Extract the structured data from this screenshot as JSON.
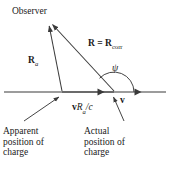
{
  "figure": {
    "background_color": "#ffffff",
    "line_color": "#3a3a3a",
    "text_color": "#1a1a1a"
  },
  "labels": {
    "observer": "Observer",
    "R_a_base": "R",
    "R_a_sub": "a",
    "R_corr_lhs": "R",
    "R_equals": " = ",
    "R_corr_base": "R",
    "R_corr_sub": "corr",
    "psi": "ψ",
    "v_vector": "v",
    "displacement_v": "v",
    "displacement_R": "R",
    "displacement_sub": "a",
    "displacement_over_c": "/c"
  },
  "captions": {
    "apparent": [
      "Apparent",
      "position of",
      "charge"
    ],
    "actual": [
      "Actual",
      "position of",
      "charge"
    ]
  },
  "geometry": {
    "observer_vertex": [
      48,
      21
    ],
    "apparent_point": [
      62,
      92
    ],
    "actual_point": [
      114,
      92
    ],
    "axis_y": 92,
    "axis_x_start": 4,
    "axis_x_end": 166,
    "axis_arrowheads_x": [
      103,
      140
    ],
    "arc_center": [
      114,
      92
    ],
    "arc_radius": 20
  }
}
